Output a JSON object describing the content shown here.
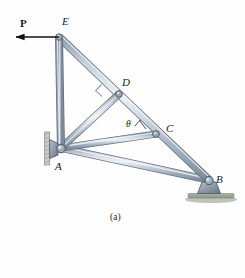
{
  "figure": {
    "caption": "(a)",
    "type": "statics-truss-free-body-diagram"
  },
  "labels": {
    "force": "P",
    "joint_e": "E",
    "joint_d": "D",
    "joint_c": "C",
    "joint_a": "A",
    "joint_b": "B",
    "angle_theta": "θ"
  },
  "geometry": {
    "joints": {
      "E": [
        59,
        37
      ],
      "A": [
        61,
        148
      ],
      "D": [
        119,
        94
      ],
      "C": [
        156,
        134
      ],
      "B": [
        209,
        180
      ]
    },
    "members": [
      {
        "name": "EA",
        "from": "E",
        "to": "A"
      },
      {
        "name": "EB",
        "from": "E",
        "to": "B"
      },
      {
        "name": "AD",
        "from": "A",
        "to": "D"
      },
      {
        "name": "AC",
        "from": "A",
        "to": "C"
      },
      {
        "name": "AB",
        "from": "A",
        "to": "B"
      }
    ],
    "force_arrow": {
      "from": [
        59,
        37
      ],
      "to": [
        14,
        37
      ],
      "direction": "left"
    },
    "right_angle_at": "D",
    "angle_marked_at": "C"
  },
  "colors": {
    "member_fill": "#b9c4cf",
    "member_edge": "#5c6a78",
    "member_highlight": "#e8edf2",
    "support_fill": "#8d9aa8",
    "ground_fill": "#9aa59b",
    "arrow": "#111111",
    "label": "#1a1a1a"
  },
  "supports": {
    "a_support": "pin-wall-bracket",
    "b_support": "pin-ground-baseplate"
  }
}
